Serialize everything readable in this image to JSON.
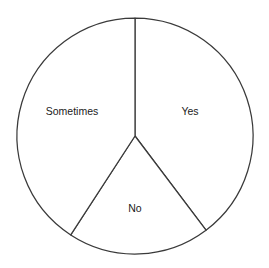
{
  "chart_data": {
    "type": "pie",
    "title": "",
    "subtitle": "",
    "xlabel": "",
    "ylabel": "",
    "legend_position": "none",
    "grid": false,
    "labels_inside": true,
    "center_x": 135,
    "center_y": 136,
    "radius": 118,
    "start_angle_deg": 0,
    "direction": "clockwise",
    "categories": [
      "Yes",
      "No",
      "Sometimes"
    ],
    "values": [
      39.7,
      19.4,
      40.9
    ],
    "value_unit": "percent",
    "angles_deg": [
      143,
      70,
      147
    ],
    "slices": [
      {
        "label": "Yes",
        "value": 39.7,
        "angle_deg": 143,
        "start_deg": 0,
        "end_deg": 143,
        "fill": "#ffffff",
        "stroke": "#3a3a3a",
        "label_x": 190,
        "label_y": 112
      },
      {
        "label": "No",
        "value": 19.4,
        "angle_deg": 70,
        "start_deg": 143,
        "end_deg": 213,
        "fill": "#ffffff",
        "stroke": "#3a3a3a",
        "label_x": 135,
        "label_y": 209
      },
      {
        "label": "Sometimes",
        "value": 40.9,
        "angle_deg": 147,
        "start_deg": 213,
        "end_deg": 360,
        "fill": "#ffffff",
        "stroke": "#3a3a3a",
        "label_x": 72,
        "label_y": 112
      }
    ],
    "colors": {
      "background": "#ffffff",
      "outline": "#3a3a3a",
      "text": "#1a1a1a"
    }
  }
}
